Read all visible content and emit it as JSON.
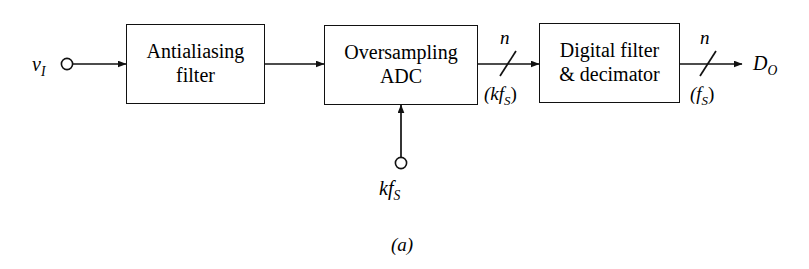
{
  "figure": {
    "caption": "(a)",
    "background_color": "#ffffff",
    "line_color": "#111111"
  },
  "input": {
    "terminal_name": "v",
    "terminal_subscript": "I",
    "icon": "open-circle-terminal"
  },
  "blocks": [
    {
      "id": "antialiasing-filter",
      "line1": "Antialiasing",
      "line2": "filter"
    },
    {
      "id": "oversampling-adc",
      "line1": "Oversampling",
      "line2": "ADC"
    },
    {
      "id": "digital-filter-decimator",
      "line1": "Digital filter",
      "line2": "& decimator"
    }
  ],
  "buses": [
    {
      "id": "adc-output-bus",
      "width_label": "n",
      "rate_label": "(kf",
      "rate_subscript": "S",
      "rate_close": ")"
    },
    {
      "id": "decimator-output-bus",
      "width_label": "n",
      "rate_label": "(f",
      "rate_subscript": "S",
      "rate_close": ")"
    }
  ],
  "clock": {
    "label_prefix": "kf",
    "label_subscript": "S",
    "icon": "open-circle-terminal"
  },
  "output": {
    "terminal_name": "D",
    "terminal_subscript": "O"
  }
}
